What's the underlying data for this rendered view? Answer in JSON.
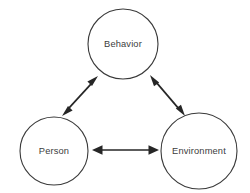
{
  "diagram": {
    "background_color": "#ffffff",
    "node_stroke_color": "#3a3a3a",
    "arrow_color": "#262626",
    "label_color": "#3c3c3c",
    "nodes": [
      {
        "id": "behavior",
        "label": "Behavior",
        "cx": 123,
        "cy": 44,
        "r": 35
      },
      {
        "id": "person",
        "label": "Person",
        "cx": 54,
        "cy": 151,
        "r": 34
      },
      {
        "id": "environment",
        "label": "Environment",
        "cx": 199,
        "cy": 151,
        "r": 38
      }
    ],
    "links": [
      {
        "id": "person-behavior",
        "from": "person",
        "to": "behavior",
        "style": "double-headed-arrow",
        "x1": 62,
        "y1": 116,
        "x2": 98,
        "y2": 76
      },
      {
        "id": "behavior-environment",
        "from": "behavior",
        "to": "environment",
        "style": "double-headed-arrow",
        "x1": 150,
        "y1": 75,
        "x2": 185,
        "y2": 116
      },
      {
        "id": "person-environment",
        "from": "person",
        "to": "environment",
        "style": "double-headed-arrow",
        "x1": 92,
        "y1": 150,
        "x2": 159,
        "y2": 150
      }
    ]
  }
}
